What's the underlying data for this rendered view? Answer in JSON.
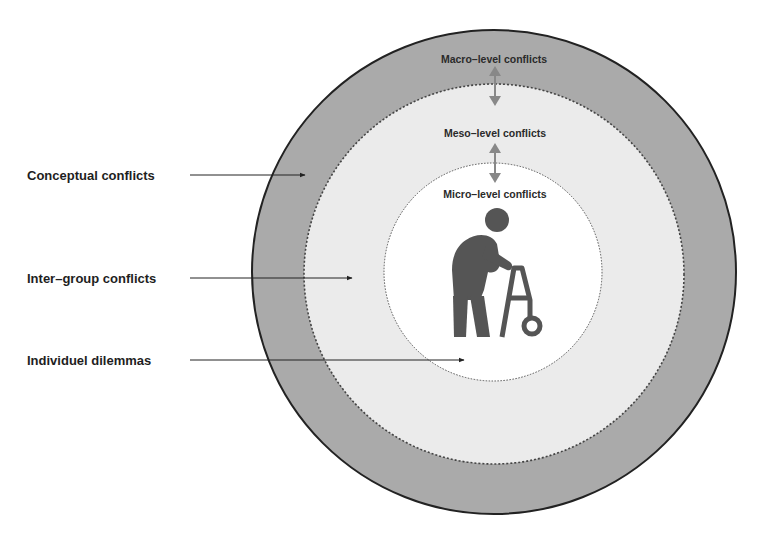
{
  "diagram": {
    "levels": {
      "macro": {
        "label": "Macro–level conflicts",
        "fill": "#aaaaaa"
      },
      "meso": {
        "label": "Meso–level conflicts",
        "fill": "#ebebeb"
      },
      "micro": {
        "label": "Micro–level conflicts",
        "fill": "#ffffff"
      }
    },
    "side_labels": [
      {
        "label": "Conceptual conflicts"
      },
      {
        "label": "Inter–group conflicts"
      },
      {
        "label": "Individuel dilemmas"
      }
    ],
    "central_icon": "elderly-person-with-walker-icon",
    "colors": {
      "outline": "#222222",
      "dotted": "#555555",
      "arrow": "#888888",
      "figure": "#555555"
    }
  }
}
